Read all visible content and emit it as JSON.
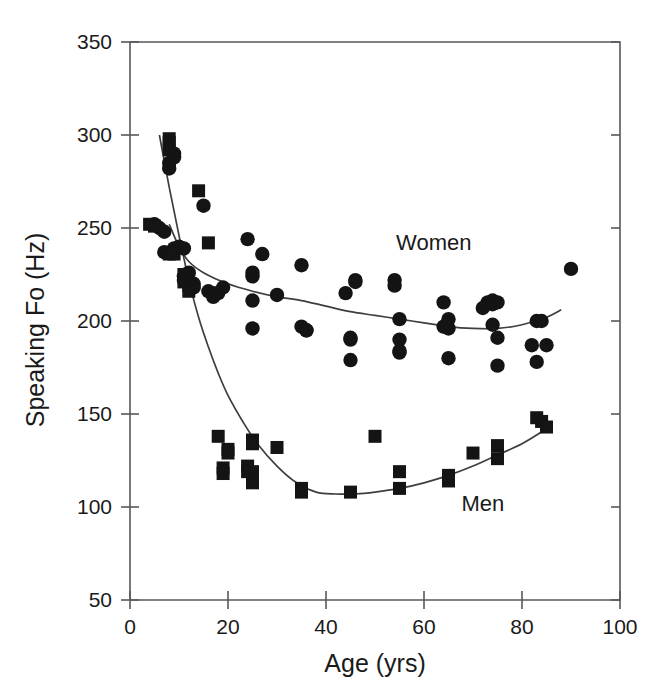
{
  "chart_data": {
    "type": "scatter",
    "title": "",
    "xlabel": "Age (yrs)",
    "ylabel": "Speaking Fo (Hz)",
    "xlim": [
      0,
      100
    ],
    "ylim": [
      50,
      350
    ],
    "xticks": [
      0,
      20,
      40,
      60,
      80,
      100
    ],
    "yticks": [
      50,
      100,
      150,
      200,
      250,
      300,
      350
    ],
    "xtick_labels": [
      "0",
      "20",
      "40",
      "60",
      "80",
      "100"
    ],
    "ytick_labels": [
      "50",
      "100",
      "150",
      "200",
      "250",
      "300",
      "350"
    ],
    "grid": false,
    "legend_position": "inline-annotations",
    "annotations": [
      {
        "text": "Women",
        "x": 62,
        "y": 238
      },
      {
        "text": "Men",
        "x": 72,
        "y": 98
      }
    ],
    "series": [
      {
        "name": "Women",
        "marker": "circle",
        "color": "#141414",
        "points": [
          [
            5,
            252
          ],
          [
            6,
            250
          ],
          [
            7,
            248
          ],
          [
            7,
            237
          ],
          [
            8,
            285
          ],
          [
            8,
            282
          ],
          [
            9,
            290
          ],
          [
            9,
            288
          ],
          [
            9,
            239
          ],
          [
            10,
            240
          ],
          [
            11,
            239
          ],
          [
            11,
            224
          ],
          [
            11,
            222
          ],
          [
            12,
            220
          ],
          [
            12,
            226
          ],
          [
            12,
            221
          ],
          [
            13,
            220
          ],
          [
            13,
            218
          ],
          [
            15,
            262
          ],
          [
            16,
            216
          ],
          [
            17,
            215
          ],
          [
            17,
            213
          ],
          [
            18,
            215
          ],
          [
            19,
            218
          ],
          [
            24,
            244
          ],
          [
            25,
            224
          ],
          [
            25,
            226
          ],
          [
            25,
            211
          ],
          [
            25,
            196
          ],
          [
            27,
            236
          ],
          [
            30,
            214
          ],
          [
            35,
            230
          ],
          [
            35,
            197
          ],
          [
            36,
            195
          ],
          [
            36,
            195
          ],
          [
            44,
            215
          ],
          [
            45,
            191
          ],
          [
            45,
            190
          ],
          [
            45,
            179
          ],
          [
            46,
            222
          ],
          [
            46,
            221
          ],
          [
            54,
            222
          ],
          [
            54,
            219
          ],
          [
            55,
            201
          ],
          [
            55,
            190
          ],
          [
            55,
            184
          ],
          [
            55,
            183
          ],
          [
            64,
            210
          ],
          [
            64,
            197
          ],
          [
            65,
            196
          ],
          [
            65,
            201
          ],
          [
            65,
            180
          ],
          [
            72,
            207
          ],
          [
            73,
            210
          ],
          [
            74,
            211
          ],
          [
            74,
            209
          ],
          [
            74,
            198
          ],
          [
            75,
            210
          ],
          [
            75,
            191
          ],
          [
            75,
            176
          ],
          [
            82,
            187
          ],
          [
            83,
            200
          ],
          [
            83,
            178
          ],
          [
            84,
            200
          ],
          [
            85,
            187
          ],
          [
            90,
            228
          ]
        ]
      },
      {
        "name": "Men",
        "marker": "square",
        "color": "#141414",
        "points": [
          [
            4,
            252
          ],
          [
            5,
            251
          ],
          [
            8,
            296
          ],
          [
            8,
            298
          ],
          [
            8,
            292
          ],
          [
            8,
            236
          ],
          [
            9,
            236
          ],
          [
            11,
            225
          ],
          [
            11,
            221
          ],
          [
            12,
            219
          ],
          [
            12,
            216
          ],
          [
            14,
            270
          ],
          [
            16,
            242
          ],
          [
            18,
            138
          ],
          [
            19,
            121
          ],
          [
            19,
            118
          ],
          [
            20,
            131
          ],
          [
            20,
            129
          ],
          [
            24,
            122
          ],
          [
            24,
            119
          ],
          [
            25,
            136
          ],
          [
            25,
            134
          ],
          [
            25,
            119
          ],
          [
            25,
            115
          ],
          [
            25,
            113
          ],
          [
            30,
            132
          ],
          [
            35,
            110
          ],
          [
            35,
            108
          ],
          [
            45,
            108
          ],
          [
            50,
            138
          ],
          [
            55,
            119
          ],
          [
            55,
            110
          ],
          [
            65,
            117
          ],
          [
            65,
            114
          ],
          [
            70,
            129
          ],
          [
            75,
            133
          ],
          [
            75,
            126
          ],
          [
            83,
            148
          ],
          [
            84,
            146
          ],
          [
            85,
            143
          ]
        ]
      }
    ],
    "fit_curves": [
      {
        "name": "Women trend",
        "description": "decreasing then slightly rising smooth fit",
        "points": [
          [
            8,
            252
          ],
          [
            10,
            240
          ],
          [
            12,
            232
          ],
          [
            15,
            226
          ],
          [
            20,
            220
          ],
          [
            25,
            216
          ],
          [
            30,
            213
          ],
          [
            35,
            211
          ],
          [
            40,
            208
          ],
          [
            45,
            205
          ],
          [
            50,
            203
          ],
          [
            55,
            201
          ],
          [
            60,
            199
          ],
          [
            65,
            197
          ],
          [
            70,
            196
          ],
          [
            75,
            196
          ],
          [
            80,
            198
          ],
          [
            85,
            202
          ],
          [
            88,
            206
          ]
        ]
      },
      {
        "name": "Men trend",
        "description": "steep decline then gradual rise",
        "points": [
          [
            6,
            300
          ],
          [
            8,
            272
          ],
          [
            10,
            246
          ],
          [
            12,
            222
          ],
          [
            14,
            202
          ],
          [
            16,
            186
          ],
          [
            18,
            172
          ],
          [
            20,
            160
          ],
          [
            23,
            146
          ],
          [
            26,
            134
          ],
          [
            30,
            122
          ],
          [
            34,
            113
          ],
          [
            38,
            108
          ],
          [
            42,
            107
          ],
          [
            46,
            107
          ],
          [
            50,
            108
          ],
          [
            55,
            110
          ],
          [
            60,
            113
          ],
          [
            65,
            117
          ],
          [
            70,
            122
          ],
          [
            75,
            128
          ],
          [
            80,
            134
          ],
          [
            85,
            142
          ]
        ]
      }
    ]
  }
}
